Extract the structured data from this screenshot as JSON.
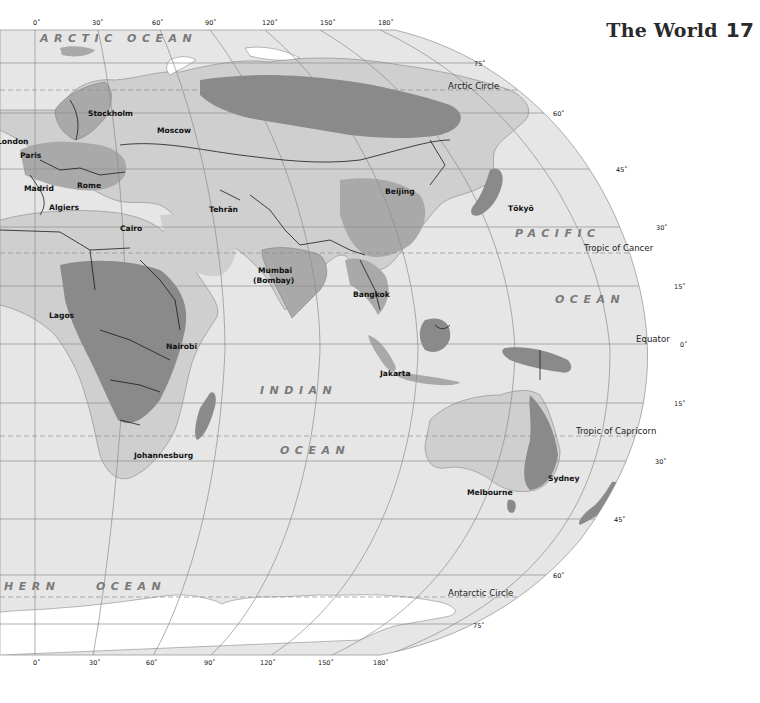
{
  "page": {
    "title": "The World",
    "page_number": "17"
  },
  "colors": {
    "ocean": "#e6e6e6",
    "land_light": "#cfcfcf",
    "land_mid": "#a9a9a9",
    "land_dark": "#8a8a8a",
    "ice": "#ffffff",
    "grid": "#8c8c8c",
    "border": "#1a1a1a",
    "ocean_label": "#7a7a7a"
  },
  "longitude_labels_top": [
    "0˚",
    "30˚",
    "60˚",
    "90˚",
    "120˚",
    "150˚",
    "180˚"
  ],
  "longitude_labels_bottom": [
    "0˚",
    "30˚",
    "60˚",
    "90˚",
    "120˚",
    "150˚",
    "180˚"
  ],
  "latitude_labels": {
    "n75": "75˚",
    "n60": "60˚",
    "n45": "45˚",
    "n30": "30˚",
    "n15": "15˚",
    "eq": "0˚",
    "s15": "15˚",
    "s30": "30˚",
    "s45": "45˚",
    "s60": "60˚",
    "s75": "75˚"
  },
  "special_lines": {
    "arctic_circle": "Arctic Circle",
    "tropic_cancer": "Tropic of Cancer",
    "equator": "Equator",
    "tropic_capricorn": "Tropic of Capricorn",
    "antarctic_circle": "Antarctic Circle"
  },
  "oceans": {
    "arctic": "ARCTIC OCEAN",
    "pacific_1": "PACIFIC",
    "pacific_2": "OCEAN",
    "indian_1": "INDIAN",
    "indian_2": "OCEAN",
    "southern_1": "HERN",
    "southern_2": "OCEAN"
  },
  "cities": [
    {
      "name": "Stockholm"
    },
    {
      "name": "Moscow"
    },
    {
      "name": "London"
    },
    {
      "name": "Paris"
    },
    {
      "name": "Madrid"
    },
    {
      "name": "Rome"
    },
    {
      "name": "Algiers"
    },
    {
      "name": "Cairo"
    },
    {
      "name": "Tehrān"
    },
    {
      "name": "Beijing"
    },
    {
      "name": "Tōkyō"
    },
    {
      "name": "Mumbai"
    },
    {
      "name": "(Bombay)"
    },
    {
      "name": "Bangkok"
    },
    {
      "name": "Lagos"
    },
    {
      "name": "Nairobi"
    },
    {
      "name": "Jakarta"
    },
    {
      "name": "Johannesburg"
    },
    {
      "name": "Melbourne"
    },
    {
      "name": "Sydney"
    }
  ]
}
